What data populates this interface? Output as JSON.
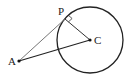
{
  "diagram": {
    "labels": {
      "A": "A",
      "P": "P",
      "C": "C"
    },
    "points": {
      "A": [
        19,
        61
      ],
      "P": [
        65,
        19
      ],
      "C": [
        90,
        40
      ]
    },
    "circle": {
      "cx": 90,
      "cy": 40,
      "r": 33
    },
    "colors": {
      "stroke": "#222222",
      "tangent": "#555555"
    }
  }
}
